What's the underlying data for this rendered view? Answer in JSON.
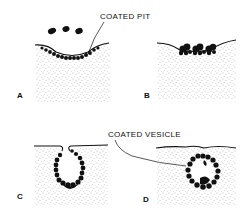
{
  "figure": {
    "colors": {
      "background": "#ffffff",
      "ink": "#111111",
      "stipple": "#7a7a7a"
    },
    "callouts": {
      "coated_pit": "COATED PIT",
      "coated_vesicle": "COATED VESICLE"
    },
    "panels": [
      {
        "id": "A",
        "label": "A",
        "description": "Shallow coated pit forming, with coat particles arriving from cytoplasm above"
      },
      {
        "id": "B",
        "label": "B",
        "description": "Coat particles clustered at membrane indentation"
      },
      {
        "id": "C",
        "label": "C",
        "description": "Deep invaginated coated pit with narrow neck"
      },
      {
        "id": "D",
        "label": "D",
        "description": "Pinched-off coated vesicle inside the cell"
      }
    ]
  }
}
